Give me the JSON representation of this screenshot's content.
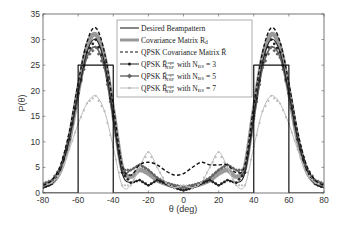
{
  "chart_data": {
    "type": "line",
    "title": "",
    "xlabel": "θ (deg)",
    "ylabel": "P(θ)",
    "xlim": [
      -80,
      80
    ],
    "ylim": [
      0,
      35
    ],
    "xticks": [
      -80,
      -60,
      -40,
      -20,
      0,
      20,
      40,
      60,
      80
    ],
    "yticks": [
      0,
      5,
      10,
      15,
      20,
      25,
      30,
      35
    ],
    "grid": false,
    "legend_position": "upper center",
    "series": [
      {
        "name": "Desired Beampattern",
        "style": "solid-black-thin",
        "color": "#111111",
        "x": [
          -80,
          -60,
          -60,
          -40,
          -40,
          40,
          40,
          60,
          60,
          80
        ],
        "y": [
          0,
          0,
          25,
          25,
          0,
          0,
          25,
          25,
          0,
          0
        ]
      },
      {
        "name": "Covariance Matrix R_d",
        "style": "thick-gray",
        "color": "#999999",
        "x": [
          -80,
          -75,
          -70,
          -65,
          -60,
          -55,
          -50,
          -45,
          -40,
          -35,
          -30,
          -25,
          -20,
          -15,
          -10,
          -5,
          0,
          5,
          10,
          15,
          20,
          25,
          30,
          35,
          40,
          45,
          50,
          55,
          60,
          65,
          70,
          75,
          80
        ],
        "y": [
          1.5,
          2.0,
          4.5,
          10.5,
          20.0,
          28.5,
          31.0,
          26.5,
          16.0,
          5.0,
          3.2,
          4.5,
          3.8,
          2.5,
          1.8,
          1.3,
          1.0,
          1.3,
          1.8,
          2.5,
          3.8,
          4.5,
          3.2,
          5.0,
          16.0,
          26.5,
          31.0,
          28.5,
          20.0,
          10.5,
          4.5,
          2.0,
          1.5
        ]
      },
      {
        "name": "QPSK Covariance Matrix R̄",
        "style": "dashed-black",
        "color": "#111111",
        "x": [
          -80,
          -75,
          -70,
          -65,
          -60,
          -55,
          -50,
          -45,
          -40,
          -35,
          -30,
          -25,
          -20,
          -15,
          -10,
          -5,
          0,
          5,
          10,
          15,
          20,
          25,
          30,
          35,
          40,
          45,
          50,
          55,
          60,
          65,
          70,
          75,
          80
        ],
        "y": [
          1.5,
          2.5,
          5.5,
          12.0,
          21.5,
          29.5,
          32.3,
          27.5,
          17.0,
          5.5,
          3.5,
          5.5,
          6.0,
          5.5,
          4.3,
          3.5,
          3.8,
          5.0,
          6.0,
          5.5,
          5.5,
          5.5,
          4.0,
          5.5,
          17.0,
          27.5,
          32.3,
          29.5,
          21.5,
          12.0,
          5.5,
          2.5,
          1.5
        ]
      },
      {
        "name": "QPSK R̄_NSP^opt with N_BS = 3",
        "style": "black-dot-marker",
        "color": "#222222",
        "x": [
          -80,
          -75,
          -70,
          -65,
          -60,
          -55,
          -50,
          -45,
          -40,
          -35,
          -30,
          -25,
          -20,
          -15,
          -10,
          -5,
          0,
          5,
          10,
          15,
          20,
          25,
          30,
          35,
          40,
          45,
          50,
          55,
          60,
          65,
          70,
          75,
          80
        ],
        "y": [
          1.0,
          1.8,
          4.5,
          10.5,
          19.5,
          27.5,
          30.0,
          25.5,
          15.0,
          4.0,
          2.0,
          2.5,
          1.5,
          2.5,
          1.8,
          1.0,
          0.5,
          1.0,
          1.8,
          2.5,
          1.5,
          2.5,
          2.0,
          4.0,
          15.0,
          25.5,
          30.0,
          27.5,
          19.5,
          10.5,
          4.5,
          1.8,
          1.0
        ]
      },
      {
        "name": "QPSK R̄_NSP^opt with N_BS = 5",
        "style": "gray-diamond-marker",
        "color": "#666666",
        "x": [
          -80,
          -75,
          -70,
          -65,
          -60,
          -55,
          -50,
          -45,
          -40,
          -35,
          -30,
          -25,
          -20,
          -15,
          -10,
          -5,
          0,
          5,
          10,
          15,
          20,
          25,
          30,
          35,
          40,
          45,
          50,
          55,
          60,
          65,
          70,
          75,
          80
        ],
        "y": [
          1.8,
          2.5,
          5.0,
          11.0,
          19.5,
          26.5,
          28.5,
          24.5,
          14.5,
          4.5,
          4.5,
          5.5,
          4.5,
          3.0,
          2.0,
          1.5,
          1.2,
          1.5,
          2.0,
          3.0,
          4.5,
          5.5,
          4.5,
          4.5,
          14.5,
          24.5,
          28.5,
          26.5,
          19.5,
          11.0,
          5.0,
          2.5,
          1.8
        ]
      },
      {
        "name": "QPSK R̄_NSP^opt with N_BS = 7",
        "style": "lightgray-marker",
        "color": "#bbbbbb",
        "x": [
          -80,
          -75,
          -70,
          -65,
          -60,
          -55,
          -50,
          -45,
          -40,
          -35,
          -30,
          -25,
          -20,
          -15,
          -10,
          -5,
          0,
          5,
          10,
          15,
          20,
          25,
          30,
          35,
          40,
          45,
          50,
          55,
          60,
          65,
          70,
          75,
          80
        ],
        "y": [
          1.5,
          2.0,
          4.0,
          8.5,
          13.5,
          17.5,
          19.0,
          16.0,
          9.0,
          1.5,
          1.5,
          5.0,
          8.0,
          5.0,
          2.0,
          1.0,
          1.5,
          1.0,
          2.0,
          5.0,
          8.0,
          5.0,
          1.5,
          1.5,
          9.0,
          16.0,
          19.0,
          17.5,
          13.5,
          8.5,
          4.0,
          2.0,
          1.5
        ]
      }
    ]
  },
  "legend": {
    "items": [
      {
        "label": "Desired Beampattern"
      },
      {
        "label": "Covariance Matrix R",
        "sub": "d",
        "bold_symbol": true
      },
      {
        "label": "QPSK Covariance Matrix R̄"
      },
      {
        "label": "QPSK R̄",
        "sup": "opt",
        "sub": "NSP",
        "suffix": "with N",
        "suffix_sub": "BS",
        "eq": "= 3"
      },
      {
        "label": "QPSK R̄",
        "sup": "opt",
        "sub": "NSP",
        "suffix": "with N",
        "suffix_sub": "BS",
        "eq": "= 5"
      },
      {
        "label": "QPSK R̄",
        "sup": "opt",
        "sub": "NSP",
        "suffix": "with N",
        "suffix_sub": "BS",
        "eq": "= 7"
      }
    ]
  },
  "axes": {
    "xlabel": "θ (deg)",
    "ylabel": "P(θ)"
  }
}
